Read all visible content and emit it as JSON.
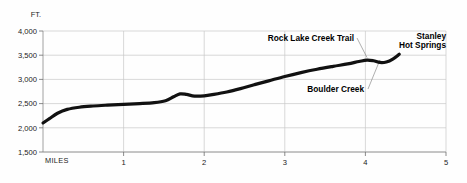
{
  "chart_data": {
    "type": "line",
    "title": "",
    "xlabel": "MILES",
    "ylabel": "FT.",
    "xlim": [
      0,
      5
    ],
    "ylim": [
      1500,
      4000
    ],
    "grid": true,
    "legend_position": "none",
    "x_ticks": [
      "1",
      "2",
      "3",
      "4",
      "5"
    ],
    "x_tick_values": [
      1,
      2,
      3,
      4,
      5
    ],
    "y_ticks": [
      "1,500",
      "2,000",
      "2,500",
      "3,000",
      "3,500",
      "4,000"
    ],
    "y_tick_values": [
      1500,
      2000,
      2500,
      3000,
      3500,
      4000
    ],
    "series": [
      {
        "name": "Trail elevation profile",
        "x": [
          0.0,
          0.08,
          0.18,
          0.3,
          0.45,
          0.62,
          0.8,
          1.0,
          1.2,
          1.38,
          1.52,
          1.62,
          1.7,
          1.78,
          1.88,
          2.0,
          2.12,
          2.28,
          2.45,
          2.62,
          2.8,
          3.0,
          3.2,
          3.4,
          3.6,
          3.78,
          3.92,
          4.02,
          4.1,
          4.18,
          4.26,
          4.34,
          4.42
        ],
        "y": [
          2100,
          2190,
          2300,
          2380,
          2425,
          2450,
          2468,
          2485,
          2500,
          2520,
          2560,
          2640,
          2700,
          2690,
          2655,
          2660,
          2690,
          2740,
          2810,
          2890,
          2970,
          3060,
          3140,
          3210,
          3270,
          3320,
          3370,
          3400,
          3385,
          3350,
          3360,
          3420,
          3520
        ]
      }
    ],
    "annotations": [
      {
        "id": "rock-lake-creek-trail",
        "label": "Rock Lake Creek Trail",
        "label_lines": [
          "Rock Lake Creek Trail"
        ],
        "x": 4.02,
        "y": 3400
      },
      {
        "id": "stanley-hot-springs",
        "label": "Stanley Hot Springs",
        "label_lines": [
          "Stanley",
          "Hot Springs"
        ],
        "x": 4.42,
        "y": 3520
      },
      {
        "id": "boulder-creek",
        "label": "Boulder Creek",
        "label_lines": [
          "Boulder Creek"
        ],
        "x": 4.18,
        "y": 3350
      }
    ],
    "colors": {
      "line": "#111111",
      "grid": "#c9c9c9",
      "axis": "#8a8a8a",
      "text": "#1a1a1a",
      "background": "#fefefe",
      "leader": "#8d8d8d"
    }
  }
}
